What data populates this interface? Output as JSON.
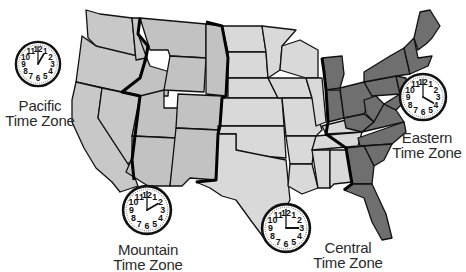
{
  "colors": {
    "pacific": "#c8c8c8",
    "mountain": "#c2c2c2",
    "central": "#d9d9d9",
    "eastern": "#6f6f6f",
    "border": "#111111",
    "text": "#2a2a2a"
  },
  "zones": [
    {
      "id": "pacific",
      "line1": "Pacific",
      "line2": "Time Zone",
      "hour": 1,
      "minute": 0
    },
    {
      "id": "mountain",
      "line1": "Mountain",
      "line2": "Time Zone",
      "hour": 2,
      "minute": 0
    },
    {
      "id": "central",
      "line1": "Central",
      "line2": "Time Zone",
      "hour": 3,
      "minute": 0
    },
    {
      "id": "eastern",
      "line1": "Eastern",
      "line2": "Time Zone",
      "hour": 4,
      "minute": 0
    }
  ],
  "clock_numbers": [
    "12",
    "1",
    "2",
    "3",
    "4",
    "5",
    "6",
    "7",
    "8",
    "9",
    "10",
    "11"
  ]
}
